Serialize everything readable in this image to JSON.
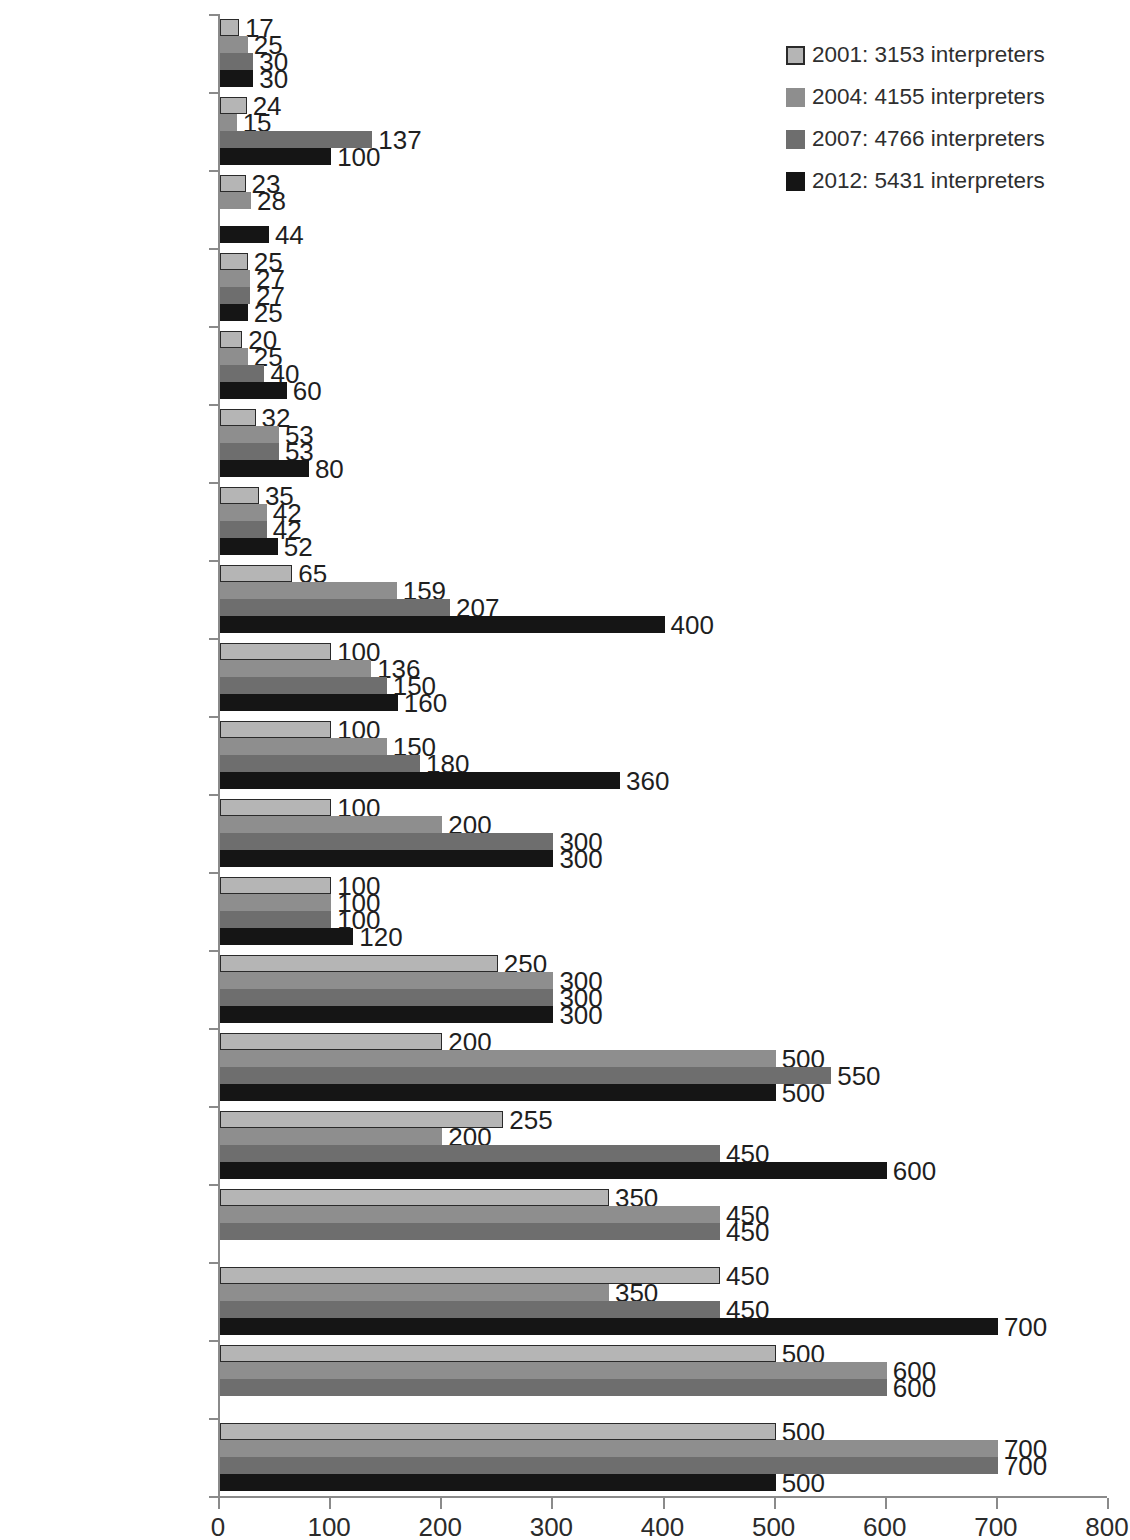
{
  "chart_data": {
    "type": "bar",
    "orientation": "horizontal",
    "title": "",
    "xlabel": "",
    "ylabel": "",
    "xlim": [
      0,
      800
    ],
    "xticks": [
      0,
      100,
      200,
      300,
      400,
      500,
      600,
      700,
      800
    ],
    "grid": false,
    "legend_position": "top-right",
    "categories": [
      "Switz.-Fr",
      "Portugal",
      "Slovenia",
      "Estonia",
      "Ireland",
      "Scotland",
      "Switz.-Ge",
      "Netherlands",
      "Belgium-Flanders",
      "France",
      "Denmark",
      "Austria",
      "Italy",
      "Norway",
      "Finland",
      "Sweden",
      "England, W. & N.I.",
      "Germany",
      "Spain"
    ],
    "series": [
      {
        "name": "2001: 3153 interpreters",
        "year": "2001",
        "total": 3153,
        "color": "#b5b5b5",
        "values": [
          17,
          24,
          23,
          25,
          20,
          32,
          35,
          65,
          100,
          100,
          100,
          100,
          250,
          200,
          255,
          350,
          450,
          500,
          500
        ]
      },
      {
        "name": "2004: 4155 interpreters",
        "year": "2004",
        "total": 4155,
        "color": "#8e8e8e",
        "values": [
          25,
          15,
          28,
          27,
          25,
          53,
          42,
          159,
          136,
          150,
          200,
          100,
          300,
          500,
          200,
          450,
          350,
          600,
          700
        ]
      },
      {
        "name": "2007: 4766 interpreters",
        "year": "2007",
        "total": 4766,
        "color": "#6e6e6e",
        "values": [
          30,
          137,
          null,
          27,
          40,
          53,
          42,
          207,
          150,
          180,
          300,
          100,
          300,
          550,
          450,
          450,
          450,
          600,
          700
        ]
      },
      {
        "name": "2012: 5431 interpreters",
        "year": "2012",
        "total": 5431,
        "color": "#151515",
        "values": [
          30,
          100,
          44,
          25,
          60,
          80,
          52,
          400,
          160,
          360,
          300,
          120,
          300,
          500,
          600,
          null,
          700,
          null,
          500
        ]
      }
    ]
  },
  "legend": {
    "items": [
      {
        "label": "2001: 3153 interpreters",
        "color": "#b5b5b5"
      },
      {
        "label": "2004: 4155 interpreters",
        "color": "#8e8e8e"
      },
      {
        "label": "2007: 4766 interpreters",
        "color": "#6e6e6e"
      },
      {
        "label": "2012: 5431 interpreters",
        "color": "#151515"
      }
    ]
  },
  "axis": {
    "x_tick_labels": [
      "0",
      "100",
      "200",
      "300",
      "400",
      "500",
      "600",
      "700",
      "800"
    ]
  }
}
